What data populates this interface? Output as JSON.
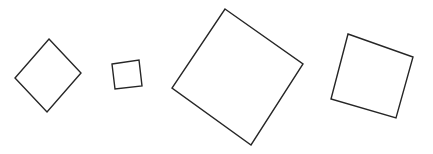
{
  "canvas": {
    "width": 433,
    "height": 154,
    "background_color": "#ffffff",
    "description": "Four outlined squares of differing sizes and rotations on a plain white background"
  },
  "style": {
    "stroke_color": "#262626",
    "stroke_width": 1.4,
    "fill": "none"
  },
  "shapes": [
    {
      "name": "square-1-diamond",
      "label": "small rotated square (diamond orientation)",
      "rotation_deg": 45,
      "side_length_px": 47,
      "center": {
        "x": 48,
        "y": 75.5
      },
      "points": "49,39 81,73 47,112 15,78",
      "vertices": [
        {
          "x": 49,
          "y": 39
        },
        {
          "x": 81,
          "y": 73
        },
        {
          "x": 47,
          "y": 112
        },
        {
          "x": 15,
          "y": 78
        }
      ]
    },
    {
      "name": "square-2-smallest",
      "label": "smallest square, slight tilt",
      "rotation_deg": -9,
      "side_length_px": 28,
      "center": {
        "x": 127,
        "y": 74.5
      },
      "points": "112,64 139,60 142,86 115,89",
      "vertices": [
        {
          "x": 112,
          "y": 64
        },
        {
          "x": 139,
          "y": 60
        },
        {
          "x": 142,
          "y": 86
        },
        {
          "x": 115,
          "y": 89
        }
      ]
    },
    {
      "name": "square-3-largest",
      "label": "largest square, strongly rotated",
      "rotation_deg": 38,
      "side_length_px": 100,
      "center": {
        "x": 237.5,
        "y": 76
      },
      "points": "225,9 303,64 251,145 172,88",
      "vertices": [
        {
          "x": 225,
          "y": 9
        },
        {
          "x": 303,
          "y": 64
        },
        {
          "x": 251,
          "y": 145
        },
        {
          "x": 172,
          "y": 88
        }
      ]
    },
    {
      "name": "square-4-right",
      "label": "medium square, modest tilt",
      "rotation_deg": 18,
      "side_length_px": 66,
      "center": {
        "x": 372,
        "y": 77
      },
      "points": "348,34 413,57 396,118 331,99",
      "vertices": [
        {
          "x": 348,
          "y": 34
        },
        {
          "x": 413,
          "y": 57
        },
        {
          "x": 396,
          "y": 118
        },
        {
          "x": 331,
          "y": 99
        }
      ]
    }
  ]
}
